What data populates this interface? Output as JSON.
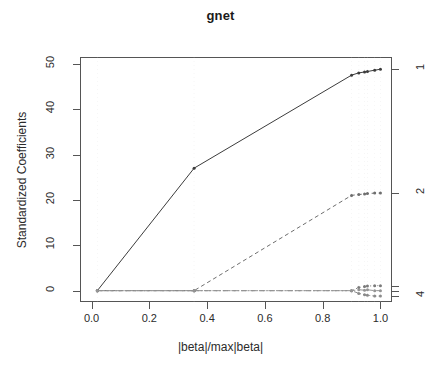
{
  "chart_data": {
    "type": "line",
    "title": "gnet",
    "xlabel": "|beta|/max|beta|",
    "ylabel": "Standardized Coefficients",
    "xlim": [
      -0.04,
      1.04
    ],
    "ylim": [
      -2.5,
      51.5
    ],
    "xticks": [
      0.0,
      0.2,
      0.4,
      0.6,
      0.8,
      1.0
    ],
    "xticklabels": [
      "0.0",
      "0.2",
      "0.4",
      "0.6",
      "0.8",
      "1.0"
    ],
    "yticks": [
      0,
      10,
      20,
      30,
      40,
      50
    ],
    "yticklabels": [
      "0",
      "10",
      "20",
      "30",
      "40",
      "50"
    ],
    "grid": false,
    "legend": "none",
    "right_axis": {
      "label": "variable index",
      "ticks": [
        {
          "value": 48.8,
          "label": "1"
        },
        {
          "value": 21.5,
          "label": "2"
        },
        {
          "value": 1.1,
          "label": ""
        },
        {
          "value": 0.0,
          "label": ""
        },
        {
          "value": -1.2,
          "label": "4"
        }
      ]
    },
    "series": [
      {
        "name": "1",
        "style": "solid",
        "color": "#3c3c3c",
        "points": [
          {
            "x": 0.02,
            "y": 0.0
          },
          {
            "x": 0.355,
            "y": 27.0
          },
          {
            "x": 0.9,
            "y": 47.5
          },
          {
            "x": 0.925,
            "y": 48.0
          },
          {
            "x": 0.945,
            "y": 48.2
          },
          {
            "x": 0.955,
            "y": 48.3
          },
          {
            "x": 0.98,
            "y": 48.6
          },
          {
            "x": 1.0,
            "y": 48.8
          }
        ]
      },
      {
        "name": "2",
        "style": "dashed",
        "color": "#6e6e6e",
        "points": [
          {
            "x": 0.02,
            "y": 0.0
          },
          {
            "x": 0.355,
            "y": 0.0
          },
          {
            "x": 0.9,
            "y": 21.0
          },
          {
            "x": 0.925,
            "y": 21.2
          },
          {
            "x": 0.945,
            "y": 21.3
          },
          {
            "x": 0.955,
            "y": 21.4
          },
          {
            "x": 0.98,
            "y": 21.5
          },
          {
            "x": 1.0,
            "y": 21.5
          }
        ]
      },
      {
        "name": "3",
        "style": "dotted",
        "color": "#7a7a7a",
        "points": [
          {
            "x": 0.02,
            "y": 0.0
          },
          {
            "x": 0.355,
            "y": 0.0
          },
          {
            "x": 0.9,
            "y": 0.0
          },
          {
            "x": 0.925,
            "y": 0.7
          },
          {
            "x": 0.945,
            "y": 0.9
          },
          {
            "x": 0.955,
            "y": 1.0
          },
          {
            "x": 0.98,
            "y": 1.1
          },
          {
            "x": 1.0,
            "y": 1.1
          }
        ]
      },
      {
        "name": "4",
        "style": "dotdash",
        "color": "#8a8a8a",
        "points": [
          {
            "x": 0.02,
            "y": 0.0
          },
          {
            "x": 0.355,
            "y": 0.0
          },
          {
            "x": 0.9,
            "y": 0.0
          },
          {
            "x": 0.925,
            "y": -0.6
          },
          {
            "x": 0.945,
            "y": -0.9
          },
          {
            "x": 0.955,
            "y": -1.0
          },
          {
            "x": 0.98,
            "y": -1.2
          },
          {
            "x": 1.0,
            "y": -1.2
          }
        ]
      },
      {
        "name": "5",
        "style": "longdash",
        "color": "#949494",
        "points": [
          {
            "x": 0.02,
            "y": 0.0
          },
          {
            "x": 0.355,
            "y": 0.0
          },
          {
            "x": 0.9,
            "y": 0.0
          },
          {
            "x": 0.925,
            "y": 0.2
          },
          {
            "x": 0.945,
            "y": 0.1
          },
          {
            "x": 0.955,
            "y": 0.2
          },
          {
            "x": 0.98,
            "y": 0.0
          },
          {
            "x": 1.0,
            "y": 0.0
          }
        ]
      }
    ],
    "breakpoints": [
      0.02,
      0.355,
      0.9,
      0.925,
      0.945,
      0.955,
      0.98,
      1.0
    ]
  }
}
